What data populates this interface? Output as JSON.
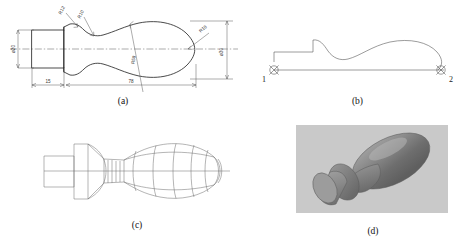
{
  "figure": {
    "panels": [
      {
        "id": "a",
        "caption": "(a)",
        "name": "dimensioned-profile-drawing",
        "description": "Dimensioned 2D outline of the handle",
        "dimensions": [
          {
            "label": "ø20",
            "name": "diameter-20-left",
            "kind": "diameter",
            "value": 20,
            "orientation": "vertical",
            "position": "left"
          },
          {
            "label": "ø30",
            "name": "diameter-30-right",
            "kind": "diameter",
            "value": 30,
            "orientation": "vertical",
            "position": "right"
          },
          {
            "label": "15",
            "name": "length-15",
            "kind": "linear",
            "value": 15,
            "orientation": "horizontal",
            "position": "bottom-left"
          },
          {
            "label": "78",
            "name": "length-78",
            "kind": "linear",
            "value": 78,
            "orientation": "horizontal",
            "position": "bottom"
          },
          {
            "label": "R12",
            "name": "radius-12",
            "kind": "radius",
            "value": 12,
            "orientation": "leader",
            "position": "top-left"
          },
          {
            "label": "R10",
            "name": "radius-10",
            "kind": "radius",
            "value": 10,
            "orientation": "leader",
            "position": "top-left-2"
          },
          {
            "label": "R18",
            "name": "radius-18",
            "kind": "radius",
            "value": 18,
            "orientation": "leader",
            "position": "right"
          },
          {
            "label": "R58",
            "name": "radius-58",
            "kind": "radius",
            "value": 58,
            "orientation": "leader",
            "position": "center"
          }
        ]
      },
      {
        "id": "b",
        "caption": "(b)",
        "name": "generatrix-curve",
        "description": "Generating profile curve with axis endpoints",
        "points": [
          {
            "label": "1",
            "name": "axis-endpoint-1",
            "position": "left"
          },
          {
            "label": "2",
            "name": "axis-endpoint-2",
            "position": "right"
          }
        ]
      },
      {
        "id": "c",
        "caption": "(c)",
        "name": "wireframe-surface-model",
        "description": "Wireframe surface of revolution"
      },
      {
        "id": "d",
        "caption": "(d)",
        "name": "shaded-solid-render",
        "description": "Shaded 3D solid model render"
      }
    ]
  },
  "colors": {
    "background": "#ffffff",
    "outline": "#2b2b2b",
    "dimension": "#5a5a5a",
    "mesh": "#6a6a6a",
    "render_backdrop": "#c9c9c9",
    "render_body_light": "#b4b4b4",
    "render_body_dark": "#757575"
  }
}
